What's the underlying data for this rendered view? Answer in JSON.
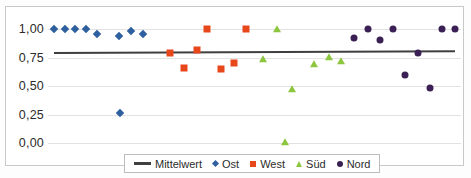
{
  "chart_data": {
    "type": "scatter",
    "title": "",
    "xlabel": "",
    "ylabel": "",
    "ylim": [
      0.0,
      1.0
    ],
    "xlim": [
      0,
      100
    ],
    "grid": true,
    "legend_position": "bottom-center",
    "ytick_labels": [
      "1,00",
      "0,75",
      "0,50",
      "0,25",
      "0,00"
    ],
    "ytick_values": [
      1.0,
      0.75,
      0.5,
      0.25,
      0.0
    ],
    "xtick_labels": [],
    "reference_line": {
      "name": "Mittelwert",
      "color": "#3f3f3f",
      "y_start": 0.795,
      "y_end": 0.81,
      "x_start": 1.5,
      "x_end": 98.5
    },
    "series": [
      {
        "name": "Ost",
        "marker": "diamond",
        "color": "#2e5f9e",
        "points": [
          {
            "x": 1.5,
            "y": 1.0
          },
          {
            "x": 4.0,
            "y": 1.0
          },
          {
            "x": 6.5,
            "y": 1.0
          },
          {
            "x": 9.2,
            "y": 1.0
          },
          {
            "x": 11.8,
            "y": 0.955
          },
          {
            "x": 17.3,
            "y": 0.94
          },
          {
            "x": 20.0,
            "y": 0.985
          },
          {
            "x": 23.0,
            "y": 0.955
          },
          {
            "x": 17.5,
            "y": 0.265
          }
        ]
      },
      {
        "name": "West",
        "marker": "square",
        "color": "#e8471c",
        "points": [
          {
            "x": 29.5,
            "y": 0.79
          },
          {
            "x": 33.0,
            "y": 0.66
          },
          {
            "x": 36.0,
            "y": 0.815
          },
          {
            "x": 38.5,
            "y": 1.0
          },
          {
            "x": 42.0,
            "y": 0.645
          },
          {
            "x": 45.0,
            "y": 0.7
          },
          {
            "x": 48.0,
            "y": 1.0
          }
        ]
      },
      {
        "name": "Süd",
        "marker": "triangle",
        "color": "#8cc63f",
        "points": [
          {
            "x": 52.0,
            "y": 0.735
          },
          {
            "x": 55.5,
            "y": 1.0
          },
          {
            "x": 59.0,
            "y": 0.47
          },
          {
            "x": 57.5,
            "y": 0.01
          },
          {
            "x": 64.5,
            "y": 0.69
          },
          {
            "x": 68.0,
            "y": 0.755
          },
          {
            "x": 71.0,
            "y": 0.72
          }
        ]
      },
      {
        "name": "Nord",
        "marker": "circle",
        "color": "#3b2055",
        "points": [
          {
            "x": 74.0,
            "y": 0.925
          },
          {
            "x": 77.5,
            "y": 1.0
          },
          {
            "x": 80.5,
            "y": 0.905
          },
          {
            "x": 83.5,
            "y": 1.0
          },
          {
            "x": 86.5,
            "y": 0.6
          },
          {
            "x": 89.5,
            "y": 0.79
          },
          {
            "x": 92.5,
            "y": 0.48
          },
          {
            "x": 95.5,
            "y": 1.0
          },
          {
            "x": 98.5,
            "y": 1.0
          }
        ]
      }
    ]
  },
  "legend": {
    "entries": [
      {
        "label": "Mittelwert",
        "marker": "line"
      },
      {
        "label": "Ost",
        "marker": "diamond"
      },
      {
        "label": "West",
        "marker": "square"
      },
      {
        "label": "Süd",
        "marker": "triangle"
      },
      {
        "label": "Nord",
        "marker": "circle"
      }
    ]
  }
}
